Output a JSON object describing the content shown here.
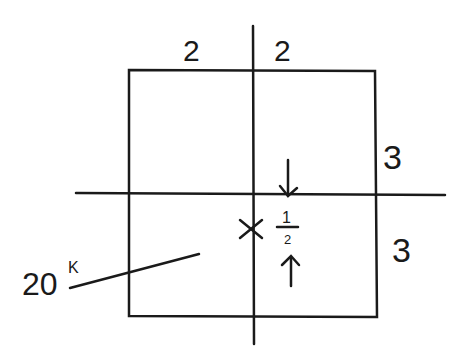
{
  "diagram": {
    "type": "column-section-eccentric-load",
    "stroke_color": "#1a1a1a",
    "background": "#ffffff",
    "dimensions": {
      "top_left": "2",
      "top_right": "2",
      "right_upper": "3",
      "right_lower": "3"
    },
    "eccentricity": {
      "numerator": "1",
      "denominator": "2",
      "marker": "×"
    },
    "load": {
      "value": "20",
      "unit": "K"
    }
  }
}
